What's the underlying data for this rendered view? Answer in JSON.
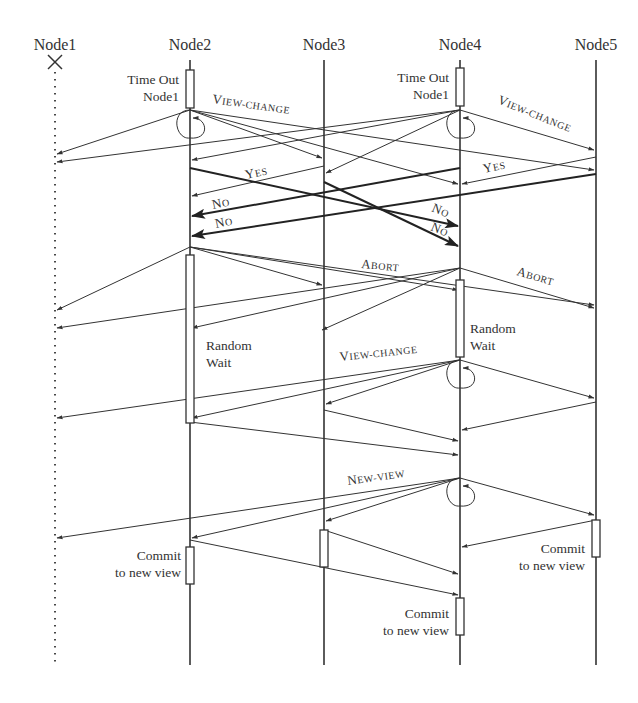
{
  "nodes": [
    {
      "id": "n1",
      "label": "Node1",
      "x": 55,
      "failed": true
    },
    {
      "id": "n2",
      "label": "Node2",
      "x": 190,
      "failed": false
    },
    {
      "id": "n3",
      "label": "Node3",
      "x": 324,
      "failed": false
    },
    {
      "id": "n4",
      "label": "Node4",
      "x": 460,
      "failed": false
    },
    {
      "id": "n5",
      "label": "Node5",
      "x": 596,
      "failed": false
    }
  ],
  "annotations": {
    "n2_timeout_1": "Time Out",
    "n2_timeout_2": "Node1",
    "n4_timeout_1": "Time Out",
    "n4_timeout_2": "Node1",
    "n2_wait_1": "Random",
    "n2_wait_2": "Wait",
    "n4_wait_1": "Random",
    "n4_wait_2": "Wait",
    "n2_commit_1": "Commit",
    "n2_commit_2": "to new view",
    "n4_commit_1": "Commit",
    "n4_commit_2": "to new view",
    "n5_commit_1": "Commit",
    "n5_commit_2": "to new view"
  },
  "message_labels": {
    "view_change_1": {
      "big": "V",
      "small": "IEW-CHANGE"
    },
    "view_change_2": {
      "big": "V",
      "small": "IEW-CHANGE"
    },
    "view_change_3": {
      "big": "V",
      "small": "IEW-CHANGE"
    },
    "yes_1": {
      "big": "Y",
      "small": "ES"
    },
    "yes_2": {
      "big": "Y",
      "small": "ES"
    },
    "no_1": {
      "big": "N",
      "small": "O"
    },
    "no_2": {
      "big": "N",
      "small": "O"
    },
    "no_3": {
      "big": "N",
      "small": "O"
    },
    "no_4": {
      "big": "N",
      "small": "O"
    },
    "abort_1": {
      "big": "A",
      "small": "BORT"
    },
    "abort_2": {
      "big": "A",
      "small": "BORT"
    },
    "new_view": {
      "big": "N",
      "small": "EW-VIEW"
    }
  },
  "messages": [
    {
      "phase": "view-change-1",
      "from": [
        190,
        110
      ],
      "to": [
        57,
        154
      ]
    },
    {
      "phase": "view-change-1",
      "from": [
        190,
        110
      ],
      "to": [
        322,
        158
      ]
    },
    {
      "phase": "view-change-1",
      "from": [
        190,
        110
      ],
      "to": [
        458,
        184
      ]
    },
    {
      "phase": "view-change-1",
      "from": [
        190,
        110
      ],
      "to": [
        594,
        170
      ]
    },
    {
      "phase": "view-change-1",
      "from": [
        460,
        110
      ],
      "to": [
        57,
        162
      ]
    },
    {
      "phase": "view-change-1",
      "from": [
        460,
        110
      ],
      "to": [
        192,
        160
      ]
    },
    {
      "phase": "view-change-1",
      "from": [
        460,
        110
      ],
      "to": [
        326,
        173
      ]
    },
    {
      "phase": "view-change-1",
      "from": [
        460,
        110
      ],
      "to": [
        594,
        150
      ]
    },
    {
      "phase": "yes",
      "from": [
        324,
        166
      ],
      "to": [
        192,
        196
      ]
    },
    {
      "phase": "yes",
      "from": [
        596,
        157
      ],
      "to": [
        462,
        184
      ]
    },
    {
      "phase": "no",
      "from": [
        190,
        168
      ],
      "to": [
        458,
        226
      ],
      "bold": true
    },
    {
      "phase": "no",
      "from": [
        324,
        182
      ],
      "to": [
        458,
        246
      ],
      "bold": true
    },
    {
      "phase": "no",
      "from": [
        460,
        168
      ],
      "to": [
        192,
        216
      ],
      "bold": true
    },
    {
      "phase": "no",
      "from": [
        596,
        174
      ],
      "to": [
        192,
        236
      ],
      "bold": true
    },
    {
      "phase": "abort",
      "from": [
        190,
        247
      ],
      "to": [
        57,
        310
      ]
    },
    {
      "phase": "abort",
      "from": [
        190,
        247
      ],
      "to": [
        322,
        285
      ]
    },
    {
      "phase": "abort",
      "from": [
        190,
        247
      ],
      "to": [
        458,
        290
      ]
    },
    {
      "phase": "abort",
      "from": [
        190,
        247
      ],
      "to": [
        594,
        305
      ]
    },
    {
      "phase": "abort",
      "from": [
        460,
        268
      ],
      "to": [
        57,
        328
      ]
    },
    {
      "phase": "abort",
      "from": [
        460,
        268
      ],
      "to": [
        192,
        328
      ]
    },
    {
      "phase": "abort",
      "from": [
        460,
        268
      ],
      "to": [
        594,
        308
      ]
    },
    {
      "phase": "abort",
      "from": [
        460,
        268
      ],
      "to": [
        322,
        330
      ]
    },
    {
      "phase": "view-change-2",
      "from": [
        460,
        360
      ],
      "to": [
        57,
        418
      ]
    },
    {
      "phase": "view-change-2",
      "from": [
        460,
        360
      ],
      "to": [
        192,
        418
      ]
    },
    {
      "phase": "view-change-2",
      "from": [
        460,
        360
      ],
      "to": [
        326,
        404
      ]
    },
    {
      "phase": "view-change-2",
      "from": [
        460,
        360
      ],
      "to": [
        594,
        398
      ]
    },
    {
      "phase": "view-change-2",
      "from": [
        596,
        402
      ],
      "to": [
        462,
        430
      ]
    },
    {
      "phase": "view-change-2",
      "from": [
        324,
        410
      ],
      "to": [
        458,
        441
      ]
    },
    {
      "phase": "view-change-2",
      "from": [
        190,
        422
      ],
      "to": [
        458,
        455
      ]
    },
    {
      "phase": "new-view",
      "from": [
        460,
        478
      ],
      "to": [
        57,
        538
      ]
    },
    {
      "phase": "new-view",
      "from": [
        460,
        478
      ],
      "to": [
        192,
        538
      ]
    },
    {
      "phase": "new-view",
      "from": [
        460,
        478
      ],
      "to": [
        326,
        521
      ]
    },
    {
      "phase": "new-view",
      "from": [
        460,
        478
      ],
      "to": [
        594,
        515
      ]
    },
    {
      "phase": "commit",
      "from": [
        596,
        520
      ],
      "to": [
        462,
        547
      ]
    },
    {
      "phase": "commit",
      "from": [
        324,
        530
      ],
      "to": [
        458,
        574
      ]
    },
    {
      "phase": "commit",
      "from": [
        190,
        540
      ],
      "to": [
        458,
        595
      ]
    }
  ]
}
